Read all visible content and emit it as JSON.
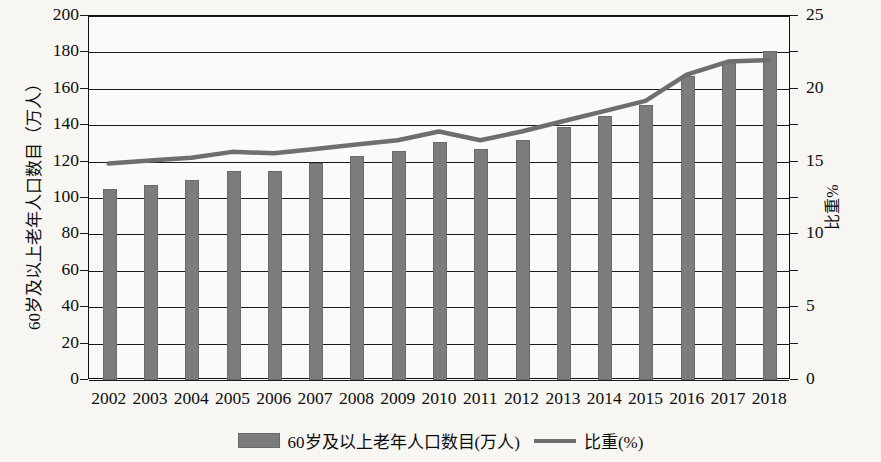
{
  "chart_data": {
    "type": "bar",
    "title": "",
    "subtitle": "",
    "xlabel": "",
    "ylabel": "60岁及以上老年人口数目（万人）",
    "ylabel_right": "比重%",
    "categories": [
      "2002",
      "2003",
      "2004",
      "2005",
      "2006",
      "2007",
      "2008",
      "2009",
      "2010",
      "2011",
      "2012",
      "2013",
      "2014",
      "2015",
      "2016",
      "2017",
      "2018"
    ],
    "ylim": [
      0,
      200
    ],
    "ylim_right": [
      0,
      25
    ],
    "yticks": [
      0,
      20,
      40,
      60,
      80,
      100,
      120,
      140,
      160,
      180,
      200
    ],
    "yticks_right": [
      0,
      5,
      10,
      15,
      20,
      25
    ],
    "grid": true,
    "legend_position": "bottom-center",
    "series": [
      {
        "name": "60岁及以上老年人口数目(万人)",
        "type": "bar",
        "axis": "left",
        "color": "#7c7c7c",
        "values": [
          105,
          107,
          110,
          115,
          115,
          119,
          123,
          126,
          131,
          127,
          132,
          139,
          145,
          151,
          167,
          175,
          181
        ]
      },
      {
        "name": "比重(%)",
        "type": "line",
        "axis": "right",
        "color": "#6e6e6e",
        "values": [
          14.8,
          15.0,
          15.2,
          15.6,
          15.5,
          15.8,
          16.1,
          16.4,
          17.0,
          16.4,
          17.0,
          17.7,
          18.4,
          19.1,
          20.9,
          21.8,
          21.9
        ]
      }
    ]
  },
  "legend": {
    "items": [
      {
        "label": "60岁及以上老年人口数目(万人)",
        "marker": "bar-swatch"
      },
      {
        "label": "比重(%)",
        "marker": "line-swatch"
      }
    ]
  }
}
